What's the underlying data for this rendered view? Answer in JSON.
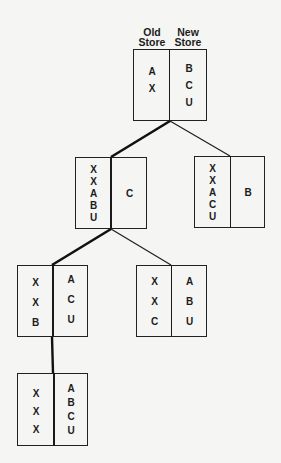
{
  "headers": {
    "old_store": "Old Store",
    "new_store": "New Store",
    "old_line1": "Old",
    "old_line2": "Store",
    "new_line1": "New",
    "new_line2": "Store"
  },
  "colors": {
    "background": "#f5f5f3",
    "ink": "#1c1c1c"
  },
  "nodes": [
    {
      "id": "root",
      "old": [
        "A",
        "X"
      ],
      "new": [
        "B",
        "C",
        "U"
      ]
    },
    {
      "id": "level2-left",
      "old": [
        "X",
        "X",
        "A",
        "B",
        "U"
      ],
      "new": [
        "C"
      ]
    },
    {
      "id": "level2-right",
      "old": [
        "X",
        "X",
        "A",
        "C",
        "U"
      ],
      "new": [
        "B"
      ]
    },
    {
      "id": "level3-left",
      "old": [
        "X",
        "X",
        "B"
      ],
      "new": [
        "A",
        "C",
        "U"
      ]
    },
    {
      "id": "level3-right",
      "old": [
        "X",
        "X",
        "C"
      ],
      "new": [
        "A",
        "B",
        "U"
      ]
    },
    {
      "id": "level4",
      "old": [
        "X",
        "X",
        "X"
      ],
      "new": [
        "A",
        "B",
        "C",
        "U"
      ]
    }
  ],
  "edges": [
    {
      "from": "root",
      "to": "level2-left",
      "bold": true
    },
    {
      "from": "root",
      "to": "level2-right",
      "bold": false
    },
    {
      "from": "level2-left",
      "to": "level3-left",
      "bold": true
    },
    {
      "from": "level2-left",
      "to": "level3-right",
      "bold": false
    },
    {
      "from": "level3-left",
      "to": "level4",
      "bold": true
    }
  ]
}
